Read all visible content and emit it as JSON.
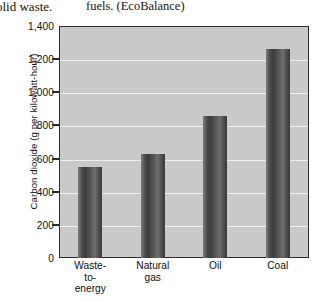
{
  "page_text": {
    "left_fragment": "olid waste.",
    "right_fragment": "fuels. (EcoBalance)"
  },
  "chart_data": {
    "type": "bar",
    "title": "",
    "xlabel": "",
    "ylabel": "Carbon dioxide (g per kilowatt-hour)",
    "categories": [
      "Waste-to-energy",
      "Natural gas",
      "Oil",
      "Coal"
    ],
    "category_lines": [
      [
        "Waste-",
        "to-",
        "energy"
      ],
      [
        "Natural",
        "gas"
      ],
      [
        "Oil"
      ],
      [
        "Coal"
      ]
    ],
    "values": [
      550,
      630,
      860,
      1260
    ],
    "ylim": [
      0,
      1400
    ],
    "yticks": [
      0,
      200,
      400,
      600,
      800,
      1000,
      1200,
      1400
    ],
    "ytick_labels": [
      "0",
      "200",
      "400",
      "600",
      "800",
      "1,000",
      "1,200",
      "1,400"
    ],
    "grid": true,
    "legend": "none",
    "colors": {
      "plot_background": "#c9c9c9",
      "gridline": "#efefef",
      "bar_dark": "#3a3a3a",
      "bar_light": "#7e7e7e",
      "axis": "#2d2d2d",
      "text": "#101010"
    }
  }
}
